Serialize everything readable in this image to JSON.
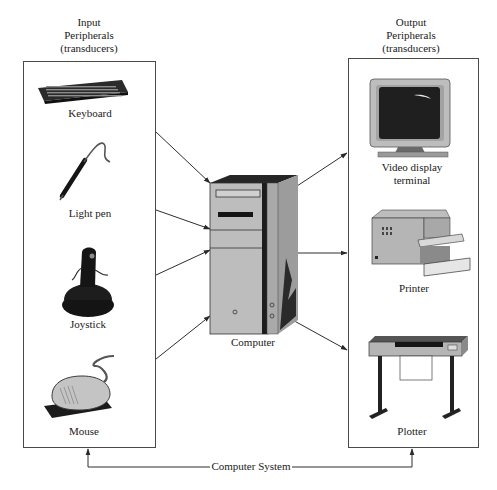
{
  "diagram": {
    "type": "block-diagram",
    "input_group": {
      "heading": [
        "Input",
        "Peripherals",
        "(transducers)"
      ],
      "devices": [
        {
          "id": "keyboard",
          "label": "Keyboard",
          "icon": "keyboard-icon"
        },
        {
          "id": "light-pen",
          "label": "Light pen",
          "icon": "light-pen-icon"
        },
        {
          "id": "joystick",
          "label": "Joystick",
          "icon": "joystick-icon"
        },
        {
          "id": "mouse",
          "label": "Mouse",
          "icon": "mouse-icon"
        }
      ]
    },
    "center": {
      "label": "Computer",
      "icon": "computer-tower-icon"
    },
    "output_group": {
      "heading": [
        "Output",
        "Peripherals",
        "(transducers)"
      ],
      "devices": [
        {
          "id": "video-display",
          "label": [
            "Video display",
            "terminal"
          ],
          "icon": "monitor-icon"
        },
        {
          "id": "printer",
          "label": "Printer",
          "icon": "printer-icon"
        },
        {
          "id": "plotter",
          "label": "Plotter",
          "icon": "plotter-icon"
        }
      ]
    },
    "bracket_label": "Computer System",
    "edges": [
      {
        "from": "input-box",
        "to": "computer",
        "count": 4,
        "direction": "input-to-computer"
      },
      {
        "from": "computer",
        "to": "output-box",
        "count": 3,
        "direction": "computer-to-output"
      },
      {
        "from": "computer-system-bracket",
        "to": [
          "input-box",
          "output-box"
        ]
      }
    ],
    "colors": {
      "line": "#333333",
      "device_dark": "#1e1e1e",
      "device_mid": "#9a9a9a",
      "device_light": "#c8c8c8"
    }
  }
}
